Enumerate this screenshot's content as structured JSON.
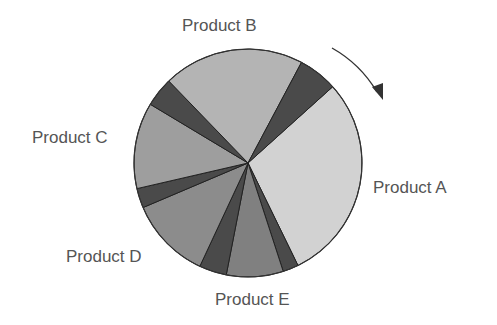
{
  "chart_data": {
    "type": "pie",
    "title": "",
    "direction": "clockwise",
    "start_angle_deg": 42,
    "slices": [
      {
        "label": "Product A",
        "value": 106,
        "color": "#d2d2d2",
        "labeled": true
      },
      {
        "label": "",
        "value": 8,
        "color": "#4a4a4a",
        "labeled": false
      },
      {
        "label": "Product E",
        "value": 29,
        "color": "#808080",
        "labeled": true
      },
      {
        "label": "",
        "value": 14,
        "color": "#4a4a4a",
        "labeled": false
      },
      {
        "label": "Product D",
        "value": 42,
        "color": "#8c8c8c",
        "labeled": true
      },
      {
        "label": "",
        "value": 10,
        "color": "#4a4a4a",
        "labeled": false
      },
      {
        "label": "Product C",
        "value": 44,
        "color": "#9e9e9e",
        "labeled": true
      },
      {
        "label": "",
        "value": 15,
        "color": "#4a4a4a",
        "labeled": false
      },
      {
        "label": "Product B",
        "value": 72,
        "color": "#b4b4b4",
        "labeled": true
      },
      {
        "label": "",
        "value": 20,
        "color": "#4a4a4a",
        "labeled": false
      }
    ],
    "labels": {
      "a": "Product A",
      "b": "Product B",
      "c": "Product C",
      "d": "Product D",
      "e": "Product E"
    },
    "annotation": "clockwise-arrow"
  }
}
